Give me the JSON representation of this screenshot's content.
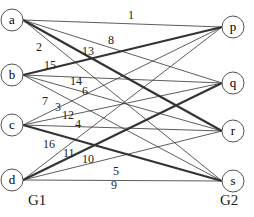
{
  "nodes": {
    "a": [
      12,
      20
    ],
    "b": [
      12,
      75
    ],
    "c": [
      12,
      125
    ],
    "d": [
      12,
      180
    ],
    "p": [
      233,
      27
    ],
    "q": [
      233,
      83
    ],
    "r": [
      233,
      131
    ],
    "s": [
      233,
      181
    ]
  },
  "node_labels": {
    "a": "a",
    "b": "b",
    "c": "c",
    "d": "d",
    "p": "p",
    "q": "q",
    "r": "r",
    "s": "s"
  },
  "edges": [
    {
      "from": "a",
      "to": "p",
      "w": "1",
      "thick": false
    },
    {
      "from": "a",
      "to": "s",
      "w": "2",
      "thick": false
    },
    {
      "from": "a",
      "to": "q",
      "w": "8",
      "thick": false
    },
    {
      "from": "a",
      "to": "r",
      "w": "13",
      "thick": true
    },
    {
      "from": "b",
      "to": "p",
      "w": "15",
      "thick": true
    },
    {
      "from": "b",
      "to": "q",
      "w": "14",
      "thick": false
    },
    {
      "from": "b",
      "to": "r",
      "w": "6",
      "thick": false
    },
    {
      "from": "b",
      "to": "s",
      "w": "7",
      "thick": false
    },
    {
      "from": "c",
      "to": "p",
      "w": "3",
      "thick": false
    },
    {
      "from": "c",
      "to": "q",
      "w": "12",
      "thick": false
    },
    {
      "from": "c",
      "to": "r",
      "w": "4",
      "thick": false
    },
    {
      "from": "c",
      "to": "s",
      "w": "16",
      "thick": true
    },
    {
      "from": "d",
      "to": "p",
      "w": "",
      "thick": false
    },
    {
      "from": "d",
      "to": "q",
      "w": "11",
      "thick": true
    },
    {
      "from": "d",
      "to": "r",
      "w": "10",
      "thick": false
    },
    {
      "from": "d",
      "to": "s",
      "w": "5",
      "thick": false
    }
  ],
  "labels": [
    {
      "t": "1",
      "x": 128,
      "y": 8
    },
    {
      "t": "2",
      "x": 36,
      "y": 40
    },
    {
      "t": "8",
      "x": 108,
      "y": 33
    },
    {
      "t": "13",
      "x": 82,
      "y": 44
    },
    {
      "t": "15",
      "x": 44,
      "y": 58
    },
    {
      "t": "14",
      "x": 70,
      "y": 74
    },
    {
      "t": "6",
      "x": 82,
      "y": 84
    },
    {
      "t": "7",
      "x": 42,
      "y": 94
    },
    {
      "t": "3",
      "x": 55,
      "y": 100
    },
    {
      "t": "12",
      "x": 62,
      "y": 108
    },
    {
      "t": "4",
      "x": 75,
      "y": 117
    },
    {
      "t": "16",
      "x": 43,
      "y": 137
    },
    {
      "t": "11",
      "x": 63,
      "y": 146
    },
    {
      "t": "10",
      "x": 82,
      "y": 152
    },
    {
      "t": "5",
      "x": 113,
      "y": 164
    },
    {
      "t": "9",
      "x": 111,
      "y": 178
    }
  ],
  "groups": {
    "left": "G1",
    "right": "G2"
  }
}
